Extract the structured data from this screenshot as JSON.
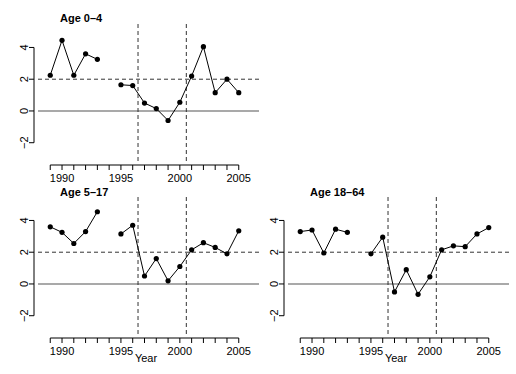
{
  "figure": {
    "width": 516,
    "height": 374,
    "background": "#ffffff",
    "foreground": "#000000"
  },
  "chart_data": [
    {
      "type": "line",
      "title": "Age 0–4",
      "xlabel": "",
      "ylabel": "",
      "xlim": [
        1988.3,
        2005.7
      ],
      "ylim": [
        -2.9,
        5.1
      ],
      "xticks": [
        1989,
        1990,
        1991,
        1992,
        1993,
        1994,
        1995,
        1996,
        1997,
        1998,
        1999,
        2000,
        2001,
        2002,
        2003,
        2004,
        2005
      ],
      "xticklabels": [
        "",
        "1990",
        "",
        "",
        "",
        "",
        "1995",
        "",
        "",
        "",
        "",
        "2000",
        "",
        "",
        "",
        "",
        "2005"
      ],
      "yticks": [
        -2,
        0,
        2,
        4
      ],
      "yticklabels": [
        "−2",
        "0",
        "2",
        "4"
      ],
      "grid": false,
      "hline_solid": 0,
      "hline_dashed": 2,
      "vlines_dashed": [
        1996.45,
        2000.55
      ],
      "series": [
        {
          "name": "segment-1",
          "x": [
            1989,
            1990,
            1991,
            1992,
            1993
          ],
          "values": [
            2.25,
            4.45,
            2.25,
            3.6,
            3.25
          ]
        },
        {
          "name": "segment-2",
          "x": [
            1995,
            1996,
            1997,
            1998,
            1999,
            2000,
            2001,
            2002,
            2003,
            2004,
            2005
          ],
          "values": [
            1.65,
            1.6,
            0.5,
            0.15,
            -0.6,
            0.55,
            2.2,
            4.05,
            1.15,
            2.0,
            1.15
          ]
        }
      ]
    },
    {
      "type": "line",
      "title": "Age 5–17",
      "xlabel": "Year",
      "ylabel": "",
      "xlim": [
        1988.3,
        2005.7
      ],
      "ylim": [
        -2.9,
        5.1
      ],
      "xticks": [
        1989,
        1990,
        1991,
        1992,
        1993,
        1994,
        1995,
        1996,
        1997,
        1998,
        1999,
        2000,
        2001,
        2002,
        2003,
        2004,
        2005
      ],
      "xticklabels": [
        "",
        "1990",
        "",
        "",
        "",
        "",
        "1995",
        "",
        "",
        "",
        "",
        "2000",
        "",
        "",
        "",
        "",
        "2005"
      ],
      "yticks": [
        -2,
        0,
        2,
        4
      ],
      "yticklabels": [
        "−2",
        "0",
        "2",
        "4"
      ],
      "grid": false,
      "hline_solid": 0,
      "hline_dashed": 2,
      "vlines_dashed": [
        1996.45,
        2000.55
      ],
      "series": [
        {
          "name": "segment-1",
          "x": [
            1989,
            1990,
            1991,
            1992,
            1993
          ],
          "values": [
            3.6,
            3.25,
            2.55,
            3.3,
            4.55
          ]
        },
        {
          "name": "segment-2",
          "x": [
            1995,
            1996,
            1997,
            1998,
            1999,
            2000,
            2001,
            2002,
            2003,
            2004,
            2005
          ],
          "values": [
            3.15,
            3.7,
            0.5,
            1.6,
            0.2,
            1.1,
            2.15,
            2.6,
            2.3,
            1.9,
            3.35
          ]
        }
      ]
    },
    {
      "type": "line",
      "title": "Age 18–64",
      "xlabel": "Year",
      "ylabel": "",
      "xlim": [
        1988.3,
        2005.7
      ],
      "ylim": [
        -2.9,
        5.1
      ],
      "xticks": [
        1989,
        1990,
        1991,
        1992,
        1993,
        1994,
        1995,
        1996,
        1997,
        1998,
        1999,
        2000,
        2001,
        2002,
        2003,
        2004,
        2005
      ],
      "xticklabels": [
        "",
        "1990",
        "",
        "",
        "",
        "",
        "1995",
        "",
        "",
        "",
        "",
        "2000",
        "",
        "",
        "",
        "",
        "2005"
      ],
      "yticks": [
        -2,
        0,
        2,
        4
      ],
      "yticklabels": [
        "−2",
        "0",
        "2",
        "4"
      ],
      "grid": false,
      "hline_solid": 0,
      "hline_dashed": 2,
      "vlines_dashed": [
        1996.45,
        2000.55
      ],
      "series": [
        {
          "name": "segment-1",
          "x": [
            1989,
            1990,
            1991,
            1992,
            1993
          ],
          "values": [
            3.3,
            3.4,
            1.95,
            3.45,
            3.25
          ]
        },
        {
          "name": "segment-2",
          "x": [
            1995,
            1996,
            1997,
            1998,
            1999,
            2000,
            2001,
            2002,
            2003,
            2004,
            2005
          ],
          "values": [
            1.9,
            2.95,
            -0.5,
            0.9,
            -0.65,
            0.45,
            2.15,
            2.4,
            2.35,
            3.15,
            3.55
          ]
        }
      ]
    }
  ],
  "panels": [
    {
      "id": "panel-age-0-4",
      "title": "Age 0–4",
      "xlabel": ""
    },
    {
      "id": "panel-age-5-17",
      "title": "Age 5–17",
      "xlabel": "Year"
    },
    {
      "id": "panel-age-18-64",
      "title": "Age 18–64",
      "xlabel": "Year"
    }
  ]
}
